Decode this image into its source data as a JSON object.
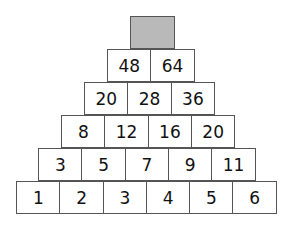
{
  "rows": [
    {
      "cells": [
        ""
      ],
      "top_cell_fill": "#b9b9b9"
    },
    {
      "cells": [
        "48",
        "64"
      ]
    },
    {
      "cells": [
        "20",
        "28",
        "36"
      ]
    },
    {
      "cells": [
        "8",
        "12",
        "16",
        "20"
      ]
    },
    {
      "cells": [
        "3",
        "5",
        "7",
        "9",
        "11"
      ]
    },
    {
      "cells": [
        "1",
        "2",
        "3",
        "4",
        "5",
        "6"
      ]
    }
  ]
}
